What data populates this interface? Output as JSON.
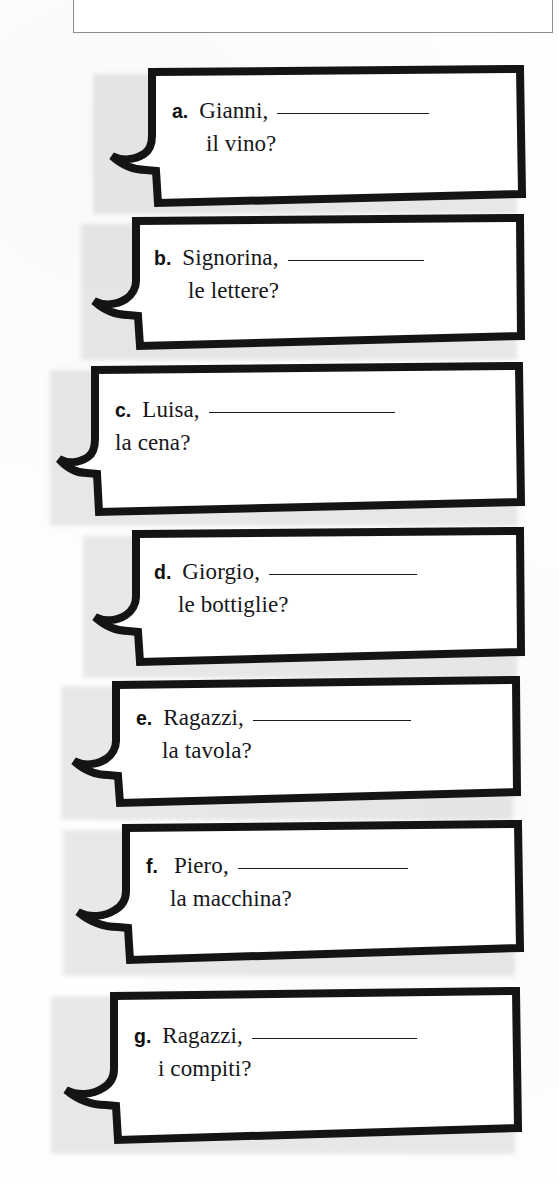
{
  "page": {
    "language": "Italian",
    "exercise_type": "fill-in-the-blank speech bubbles",
    "background_color": "#ffffff",
    "ink_color": "#16161a"
  },
  "top_box": {
    "visible_text": "",
    "note": "partially cropped box at top of page, text cut off above frame"
  },
  "bubbles": [
    {
      "label": "a.",
      "vocative": "Gianni,",
      "blank_width_px": 152,
      "line2": "il vino?"
    },
    {
      "label": "b.",
      "vocative": "Signorina,",
      "blank_width_px": 136,
      "line2": "le lettere?"
    },
    {
      "label": "c.",
      "vocative": "Luisa,",
      "blank_width_px": 186,
      "line2": "la cena?"
    },
    {
      "label": "d.",
      "vocative": "Giorgio,",
      "blank_width_px": 148,
      "line2": "le bottiglie?"
    },
    {
      "label": "e.",
      "vocative": "Ragazzi,",
      "blank_width_px": 158,
      "line2": "la tavola?"
    },
    {
      "label": "f.",
      "vocative": "Piero,",
      "blank_width_px": 170,
      "line2": "la macchina?"
    },
    {
      "label": "g.",
      "vocative": "Ragazzi,",
      "blank_width_px": 165,
      "line2": "i compiti?"
    }
  ]
}
